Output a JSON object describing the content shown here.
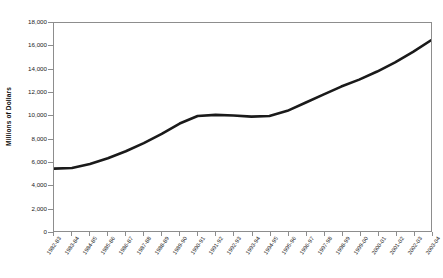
{
  "chart_data": {
    "type": "line",
    "title": "",
    "xlabel": "",
    "ylabel": "Millions of Dollars",
    "ylim": [
      0,
      18000
    ],
    "ytick_step": 2000,
    "grid": false,
    "legend": "none",
    "line_color": "#1a1a1a",
    "categories": [
      "1982-83",
      "1983-84",
      "1984-85",
      "1985-86",
      "1986-87",
      "1987-88",
      "1988-89",
      "1989-90",
      "1990-91",
      "1991-92",
      "1992-93",
      "1993-94",
      "1994-95",
      "1995-96",
      "1996-97",
      "1997-98",
      "1998-99",
      "1999-00",
      "2000-01",
      "2001-02",
      "2002-03",
      "2003-04"
    ],
    "values": [
      5400,
      5450,
      5800,
      6300,
      6900,
      7600,
      8400,
      9300,
      9950,
      10050,
      10000,
      9900,
      9950,
      10400,
      11100,
      11800,
      12500,
      13100,
      13800,
      14600,
      15500,
      16500
    ],
    "ytick_labels": [
      "18,000",
      "16,000",
      "14,000",
      "12,000",
      "10,000",
      "8,000",
      "6,000",
      "4,000",
      "2,000",
      "0"
    ]
  }
}
